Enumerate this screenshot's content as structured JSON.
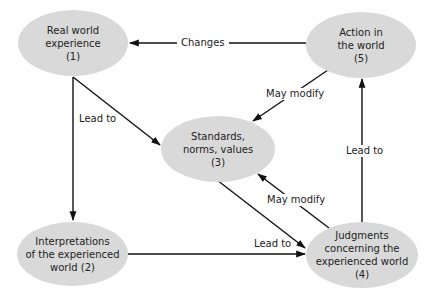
{
  "diagram": {
    "nodes": [
      {
        "id": "n1",
        "lines": [
          "Real world",
          "experience",
          "(1)"
        ]
      },
      {
        "id": "n2",
        "lines": [
          "Interpretations",
          "of the experienced",
          "world (2)"
        ]
      },
      {
        "id": "n3",
        "lines": [
          "Standards,",
          "norms, values",
          "(3)"
        ]
      },
      {
        "id": "n4",
        "lines": [
          "Judgments",
          "concerning the",
          "experienced world",
          "(4)"
        ]
      },
      {
        "id": "n5",
        "lines": [
          "Action in",
          "the world",
          "(5)"
        ]
      }
    ],
    "edges": [
      {
        "from": "n5",
        "to": "n1",
        "label": "Changes"
      },
      {
        "from": "n1",
        "to": "n3",
        "label": "Lead to"
      },
      {
        "from": "n1",
        "to": "n2",
        "label": ""
      },
      {
        "from": "n5",
        "to": "n3",
        "label": "May modify"
      },
      {
        "from": "n4",
        "to": "n5",
        "label": "Lead to"
      },
      {
        "from": "n3",
        "to": "n4",
        "label": ""
      },
      {
        "from": "n4",
        "to": "n3",
        "label": "May modify"
      },
      {
        "from": "n2",
        "to": "n4",
        "label": "Lead to"
      }
    ],
    "colors": {
      "node_fill": "#d9d9d9",
      "edge": "#111111",
      "text": "#222222"
    }
  }
}
